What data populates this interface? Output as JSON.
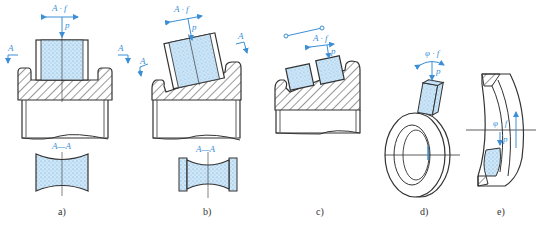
{
  "figure": {
    "colors": {
      "outline": "#333333",
      "annotation": "#3a8fd6",
      "stone_fill": "#cfe6f7",
      "stone_dots": "#5ba3dc"
    },
    "panels": [
      {
        "id": "a",
        "caption": "a)",
        "motion_label": "A · f",
        "pressure_label": "p",
        "section_mark_left": "A",
        "section_mark_right": "A",
        "section_title": "A—A"
      },
      {
        "id": "b",
        "caption": "b)",
        "motion_label": "A · f",
        "pressure_label": "p",
        "section_mark_left": "A",
        "section_mark_right": "A",
        "section_title": "A—A"
      },
      {
        "id": "c",
        "caption": "c)",
        "motion_label": "A · f",
        "pressure_label": "p"
      },
      {
        "id": "d",
        "caption": "d)",
        "motion_label": "φ · f",
        "pressure_label": "p"
      },
      {
        "id": "e",
        "caption": "e)",
        "motion_label": "φ · f",
        "pressure_label": "p"
      }
    ]
  }
}
